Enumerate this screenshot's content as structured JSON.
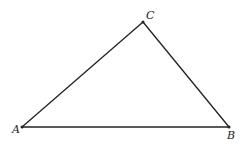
{
  "diagram": {
    "type": "triangle",
    "vertices": [
      {
        "label": "A",
        "x": 22,
        "y": 127,
        "label_x": 12,
        "label_y": 133
      },
      {
        "label": "B",
        "x": 229,
        "y": 127,
        "label_x": 227,
        "label_y": 139
      },
      {
        "label": "C",
        "x": 143,
        "y": 22,
        "label_x": 146,
        "label_y": 19
      }
    ],
    "edges": [
      [
        "A",
        "B"
      ],
      [
        "B",
        "C"
      ],
      [
        "C",
        "A"
      ]
    ],
    "stroke_color": "#222222"
  }
}
